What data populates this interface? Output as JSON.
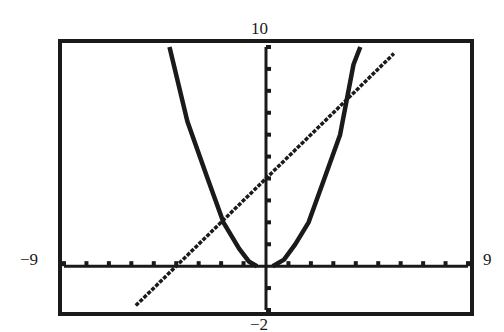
{
  "chart_data": {
    "type": "line",
    "title": "",
    "xlabel": "",
    "ylabel": "",
    "window": {
      "xmin": -9,
      "xmax": 9,
      "ymin": -2,
      "ymax": 10,
      "xscl": 1,
      "yscl": 1
    },
    "xlim": [
      -9,
      9
    ],
    "ylim": [
      -2,
      10
    ],
    "tick_labels": {
      "xmin": "−9",
      "xmax": "9",
      "ymin": "−2",
      "ymax": "10"
    },
    "grid": false,
    "legend": null,
    "series": [
      {
        "name": "line",
        "equation": "y = x + 4",
        "points": [
          [
            -5.8,
            -1.8
          ],
          [
            5.7,
            9.7
          ]
        ]
      },
      {
        "name": "left-curve",
        "points": [
          [
            -4.3,
            10
          ],
          [
            -3.5,
            6.6
          ],
          [
            -2.6,
            4
          ],
          [
            -1.9,
            2
          ],
          [
            -1.2,
            0.8
          ],
          [
            -0.75,
            0.2
          ],
          [
            -0.4,
            0
          ]
        ]
      },
      {
        "name": "right-curve",
        "points": [
          [
            0.3,
            0
          ],
          [
            0.8,
            0.3
          ],
          [
            1.3,
            1.0
          ],
          [
            1.9,
            2
          ],
          [
            2.6,
            4
          ],
          [
            3.3,
            6
          ],
          [
            3.9,
            9.2
          ],
          [
            4.2,
            10
          ]
        ]
      }
    ],
    "intersections": [
      [
        -1.9,
        2.0
      ],
      [
        3.9,
        9.2
      ]
    ]
  },
  "colors": {
    "ink": "#1a1a1a",
    "background": "#ffffff"
  },
  "layout": {
    "frame": {
      "left": 60,
      "top": 41,
      "right": 472,
      "bottom": 314
    },
    "origin_px": [
      265,
      260
    ]
  }
}
